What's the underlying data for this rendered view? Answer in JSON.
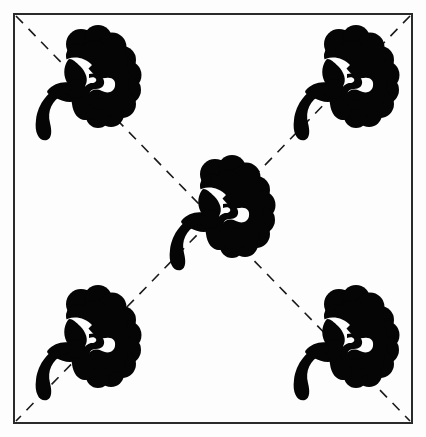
{
  "canvas": {
    "width": 426,
    "height": 437,
    "background_color": "#fdfdfd",
    "title": "Symmetrical floral motif tile pattern"
  },
  "frame": {
    "name": "border-rectangle",
    "x": 14,
    "y": 14,
    "width": 398,
    "height": 409,
    "stroke_color": "#2a2a2a",
    "stroke_width": 2,
    "fill": "none"
  },
  "guides": {
    "stroke_color": "#1a1a1a",
    "stroke_width": 1.6,
    "dash_length": 10,
    "gap_length": 8,
    "lines": [
      {
        "name": "diagonal-guide-nw-se",
        "label": "Diagonal guide from top-left to bottom-right",
        "x1": 16,
        "y1": 16,
        "x2": 410,
        "y2": 421
      },
      {
        "name": "diagonal-guide-ne-sw",
        "label": "Diagonal guide from top-right to bottom-left",
        "x1": 410,
        "y1": 16,
        "x2": 16,
        "y2": 421
      }
    ]
  },
  "motif": {
    "name": "floral-motif",
    "label": "Stylized flower with berry cluster and curved stem",
    "fill_color": "#050505",
    "nominal_size": 112,
    "parts": [
      {
        "name": "berry-cluster",
        "label": "Cloud-like cluster of overlapping round lobes"
      },
      {
        "name": "trefoil-flower",
        "label": "Three-petal flower"
      },
      {
        "name": "curved-stem",
        "label": "Crescent-shaped stem hook"
      },
      {
        "name": "inner-scroll",
        "label": "Hooked scroll between flower and cluster"
      }
    ]
  },
  "placements": [
    {
      "name": "motif-top-left",
      "label": "Top-left motif",
      "x": 32,
      "y": 28,
      "scale": 1.0
    },
    {
      "name": "motif-top-right",
      "label": "Top-right motif",
      "x": 290,
      "y": 28,
      "scale": 1.0
    },
    {
      "name": "motif-center",
      "label": "Center motif",
      "x": 166,
      "y": 158,
      "scale": 1.0
    },
    {
      "name": "motif-bottom-left",
      "label": "Bottom-left motif",
      "x": 32,
      "y": 288,
      "scale": 1.0
    },
    {
      "name": "motif-bottom-right",
      "label": "Bottom-right motif",
      "x": 290,
      "y": 288,
      "scale": 1.0
    }
  ],
  "counts": {
    "motif_count": 5,
    "guide_count": 2,
    "frame_count": 1
  }
}
